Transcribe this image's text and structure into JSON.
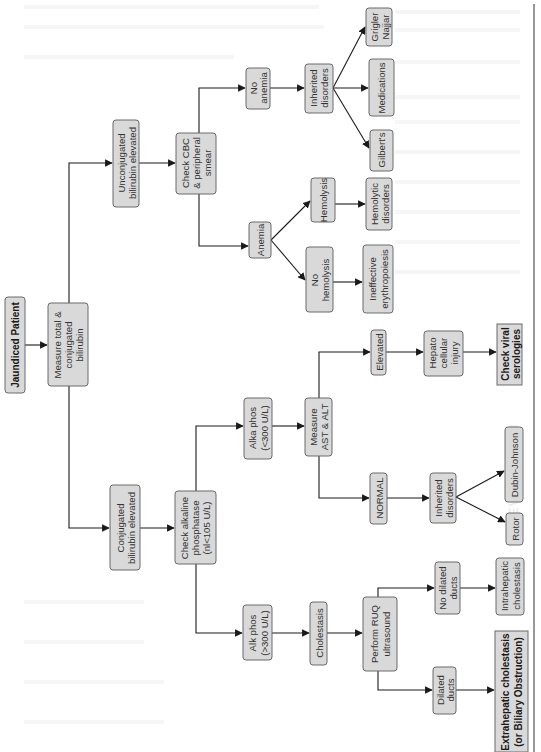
{
  "diagram": {
    "orientation": "rotated-90-ccw",
    "colors": {
      "box_fill": "#d9d9d9",
      "box_stroke": "#6a6a6a",
      "text": "#333333",
      "arrow": "#1a1a1a",
      "background": "#ffffff"
    },
    "nodes": {
      "jaundiced": {
        "lines": [
          "Jaundiced Patient"
        ],
        "bold": true
      },
      "measure_bili": {
        "lines": [
          "Measure total &",
          "conjugated",
          "bilirubin"
        ]
      },
      "unconj": {
        "lines": [
          "Unconjugated",
          "bilirubin elevated"
        ]
      },
      "conj": {
        "lines": [
          "Conjugated",
          "bilirubin elevated"
        ]
      },
      "cbc": {
        "lines": [
          "Check CBC",
          "& peripheral",
          "smear"
        ]
      },
      "alkphos_check": {
        "lines": [
          "Check alkaline",
          "phosphatase",
          "(nl<105 U/L)"
        ]
      },
      "no_anemia": {
        "lines": [
          "No",
          "anemia"
        ]
      },
      "anemia": {
        "lines": [
          "Anemia"
        ]
      },
      "inherited_top": {
        "lines": [
          "Inherited",
          "disorders"
        ]
      },
      "hemolysis": {
        "lines": [
          "Hemolysis"
        ]
      },
      "no_hemolysis": {
        "lines": [
          "No",
          "hemolysis"
        ]
      },
      "alka_low": {
        "lines": [
          "Alka phos",
          "(<300 U/L)"
        ]
      },
      "alk_high": {
        "lines": [
          "Alk phos",
          "(>300 U/L)"
        ]
      },
      "ast_alt": {
        "lines": [
          "Measure",
          "AST & ALT"
        ]
      },
      "grigler": {
        "lines": [
          "Grigler",
          "Najjar"
        ]
      },
      "medications": {
        "lines": [
          "Medications"
        ]
      },
      "gilberts": {
        "lines": [
          "Gilbert's"
        ]
      },
      "hemolytic": {
        "lines": [
          "Hemolytic",
          "disorders"
        ]
      },
      "ineffective": {
        "lines": [
          "Ineffective",
          "erythropoiesis"
        ]
      },
      "elevated": {
        "lines": [
          "Elevated"
        ]
      },
      "hepato": {
        "lines": [
          "Hepato",
          "cellular",
          "injury"
        ]
      },
      "viral": {
        "lines": [
          "Check viral",
          "serologies"
        ],
        "bold": true
      },
      "normal": {
        "lines": [
          "NORMAL"
        ]
      },
      "inherited_bottom": {
        "lines": [
          "Inherited",
          "disorders"
        ]
      },
      "dubin": {
        "lines": [
          "Dubin-Johnson"
        ]
      },
      "rotor": {
        "lines": [
          "Rotor"
        ]
      },
      "cholestasis": {
        "lines": [
          "Cholestasis"
        ]
      },
      "ruq": {
        "lines": [
          "Perform RUQ",
          "ultrasound"
        ]
      },
      "no_dilated": {
        "lines": [
          "No dilated",
          "ducts"
        ]
      },
      "dilated": {
        "lines": [
          "Dilated",
          "ducts"
        ]
      },
      "intrahepatic": {
        "lines": [
          "Intrahepatic",
          "cholestasis"
        ]
      },
      "extrahepatic": {
        "lines": [
          "Extrahepatic cholestasis",
          "(or Biliary Obstruction)"
        ],
        "bold": true
      }
    },
    "edges": [
      [
        "jaundiced",
        "measure_bili"
      ],
      [
        "measure_bili",
        "unconj"
      ],
      [
        "measure_bili",
        "conj"
      ],
      [
        "unconj",
        "cbc"
      ],
      [
        "conj",
        "alkphos_check"
      ],
      [
        "cbc",
        "no_anemia"
      ],
      [
        "cbc",
        "anemia"
      ],
      [
        "no_anemia",
        "inherited_top"
      ],
      [
        "inherited_top",
        "grigler"
      ],
      [
        "inherited_top",
        "medications"
      ],
      [
        "inherited_top",
        "gilberts"
      ],
      [
        "anemia",
        "hemolysis"
      ],
      [
        "anemia",
        "no_hemolysis"
      ],
      [
        "hemolysis",
        "hemolytic"
      ],
      [
        "no_hemolysis",
        "ineffective"
      ],
      [
        "alkphos_check",
        "alka_low"
      ],
      [
        "alkphos_check",
        "alk_high"
      ],
      [
        "alka_low",
        "ast_alt"
      ],
      [
        "ast_alt",
        "elevated"
      ],
      [
        "ast_alt",
        "normal"
      ],
      [
        "elevated",
        "hepato"
      ],
      [
        "hepato",
        "viral"
      ],
      [
        "normal",
        "inherited_bottom"
      ],
      [
        "inherited_bottom",
        "dubin"
      ],
      [
        "inherited_bottom",
        "rotor"
      ],
      [
        "alk_high",
        "cholestasis"
      ],
      [
        "cholestasis",
        "ruq"
      ],
      [
        "ruq",
        "no_dilated"
      ],
      [
        "ruq",
        "dilated"
      ],
      [
        "no_dilated",
        "intrahepatic"
      ],
      [
        "dilated",
        "extrahepatic"
      ]
    ]
  },
  "background_artifacts": {
    "faded_heading": "EVALUATION"
  }
}
